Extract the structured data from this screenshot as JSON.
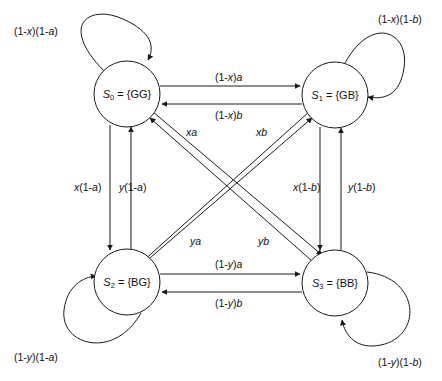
{
  "diagram": {
    "stroke_color": "#1a1a1a",
    "text_color": "#111111",
    "background": "#ffffff",
    "node_radius": 33,
    "nodes": [
      {
        "id": "S0",
        "name": "S",
        "index": "0",
        "set": "= {GG}",
        "cx": 127,
        "cy": 94
      },
      {
        "id": "S1",
        "name": "S",
        "index": "1",
        "set": "= {GB}",
        "cx": 335,
        "cy": 95
      },
      {
        "id": "S2",
        "name": "S",
        "index": "2",
        "set": "= {BG}",
        "cx": 127,
        "cy": 282
      },
      {
        "id": "S3",
        "name": "S",
        "index": "3",
        "set": "= {BB}",
        "cx": 335,
        "cy": 283
      }
    ],
    "self_loops": [
      {
        "id": "loop-s0",
        "from": "S0",
        "to": "S0",
        "label": "(1-x)(1-a)",
        "label_x": 14,
        "label_y": 26
      },
      {
        "id": "loop-s1",
        "from": "S1",
        "to": "S1",
        "label": "(1-x)(1-b)",
        "label_x": 378,
        "label_y": 14
      },
      {
        "id": "loop-s2",
        "from": "S2",
        "to": "S2",
        "label": "(1-y)(1-a)",
        "label_x": 14,
        "label_y": 352
      },
      {
        "id": "loop-s3",
        "from": "S3",
        "to": "S3",
        "label": "(1-y)(1-b)",
        "label_x": 378,
        "label_y": 357
      }
    ],
    "edges": [
      {
        "id": "e-s0-s1",
        "from": "S0",
        "to": "S1",
        "label": "(1-x)a",
        "label_x": 215,
        "label_y": 72,
        "orientation": "horizontal-top"
      },
      {
        "id": "e-s1-s0",
        "from": "S1",
        "to": "S0",
        "label": "(1-x)b",
        "label_x": 215,
        "label_y": 110,
        "orientation": "horizontal-top"
      },
      {
        "id": "e-s2-s3",
        "from": "S2",
        "to": "S3",
        "label": "(1-y)a",
        "label_x": 215,
        "label_y": 259,
        "orientation": "horizontal-bottom"
      },
      {
        "id": "e-s3-s2",
        "from": "S3",
        "to": "S2",
        "label": "(1-y)b",
        "label_x": 215,
        "label_y": 298,
        "orientation": "horizontal-bottom"
      },
      {
        "id": "e-s0-s2",
        "from": "S0",
        "to": "S2",
        "label": "x(1-a)",
        "label_x": 74,
        "label_y": 182,
        "orientation": "vertical-left"
      },
      {
        "id": "e-s2-s0",
        "from": "S2",
        "to": "S0",
        "label": "y(1-a)",
        "label_x": 119,
        "label_y": 182,
        "orientation": "vertical-left"
      },
      {
        "id": "e-s1-s3",
        "from": "S1",
        "to": "S3",
        "label": "x(1-b)",
        "label_x": 293,
        "label_y": 182,
        "orientation": "vertical-right"
      },
      {
        "id": "e-s3-s1",
        "from": "S3",
        "to": "S1",
        "label": "y(1-b)",
        "label_x": 348,
        "label_y": 182,
        "orientation": "vertical-right"
      },
      {
        "id": "e-s3-s0",
        "from": "S3",
        "to": "S0",
        "label": "xa",
        "label_x": 186,
        "label_y": 127,
        "orientation": "diagonal"
      },
      {
        "id": "e-s2-s1",
        "from": "S2",
        "to": "S1",
        "label": "xb",
        "label_x": 256,
        "label_y": 127,
        "orientation": "diagonal"
      },
      {
        "id": "e-s1-s2",
        "from": "S1",
        "to": "S2",
        "label": "ya",
        "label_x": 190,
        "label_y": 236,
        "orientation": "diagonal"
      },
      {
        "id": "e-s0-s3",
        "from": "S0",
        "to": "S3",
        "label": "yb",
        "label_x": 258,
        "label_y": 236,
        "orientation": "diagonal"
      }
    ]
  }
}
